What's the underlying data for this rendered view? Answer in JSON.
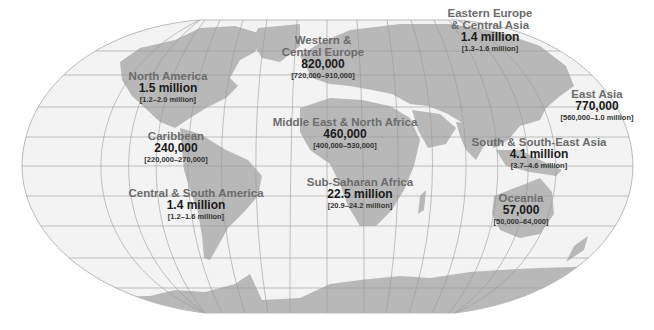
{
  "map": {
    "projection": "flat-polar pseudo-cylindrical world map",
    "colors": {
      "ocean": "#f3f3f3",
      "land": "#b8b8b8",
      "grid": "#9a9a9a",
      "region_label": "#6b6b6b",
      "value_text": "#1a1a1a"
    },
    "regions": [
      {
        "name": "North America",
        "value": "1.5 million",
        "range": "[1.2–2.0 million]",
        "x": 168,
        "y": 70
      },
      {
        "name": "Western &",
        "name2": "Central Europe",
        "value": "820,000",
        "range": "[720,000–910,000]",
        "x": 323,
        "y": 34
      },
      {
        "name": "Eastern Europe",
        "name2": "& Central Asia",
        "value": "1.4 million",
        "range": "[1.3–1.6 million]",
        "x": 490,
        "y": 7
      },
      {
        "name": "East Asia",
        "value": "770,000",
        "range": "[560,000–1.0 million]",
        "x": 597,
        "y": 88
      },
      {
        "name": "Caribbean",
        "value": "240,000",
        "range": "[220,000–270,000]",
        "x": 176,
        "y": 130
      },
      {
        "name": "Middle East & North Africa",
        "value": "460,000",
        "range": "[400,000–530,000]",
        "x": 345,
        "y": 116
      },
      {
        "name": "South & South-East Asia",
        "value": "4.1 million",
        "range": "[3.7–4.6 million]",
        "x": 539,
        "y": 136
      },
      {
        "name": "Central & South America",
        "value": "1.4 million",
        "range": "[1.2–1.6 million]",
        "x": 196,
        "y": 187
      },
      {
        "name": "Sub-Saharan Africa",
        "value": "22.5 million",
        "range": "[20.9–24.2 million]",
        "x": 360,
        "y": 176
      },
      {
        "name": "Oceania",
        "value": "57,000",
        "range": "[50,000–64,000]",
        "x": 521,
        "y": 192
      }
    ]
  }
}
